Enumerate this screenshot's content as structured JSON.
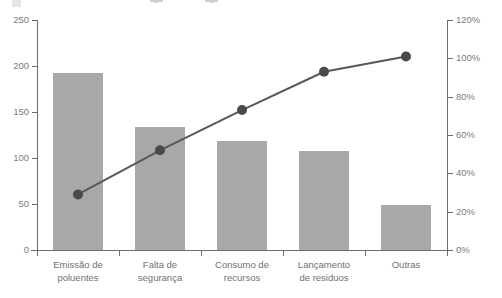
{
  "legend": {
    "entries": [
      {
        "name": "frequency-legend",
        "type": "bar-swatch",
        "label": ""
      },
      {
        "name": "cumulative-legend",
        "type": "line-swatch",
        "label": ""
      },
      {
        "name": "target-legend",
        "type": "line-swatch",
        "label": ""
      }
    ]
  },
  "colors": {
    "bar_fill": "#a8a8a8",
    "line_stroke": "#58585a",
    "marker_fill": "#4a4a4c",
    "axis": "#6e6e70",
    "tick_text": "#7b7b7d",
    "category_text": "#6f6f71",
    "plot_background": "#ffffff"
  },
  "axes": {
    "left": {
      "name": "frequency-axis",
      "ticks": [
        "0",
        "50",
        "100",
        "150",
        "200",
        "250"
      ],
      "min": 0,
      "max": 250
    },
    "right": {
      "name": "cumulative-percent-axis",
      "ticks": [
        "0%",
        "20%",
        "40%",
        "60%",
        "80%",
        "100%",
        "120%"
      ],
      "min": 0,
      "max": 120
    }
  },
  "chart_data": {
    "type": "bar",
    "title": "",
    "subtitle": "",
    "xlabel": "",
    "ylabel": "",
    "y2label": "",
    "grid": false,
    "legend_position": "top",
    "categories": [
      "Emissão de poluentes",
      "Falta de segurança",
      "Consumo de recursos",
      "Lançamento de resíduos",
      "Outras"
    ],
    "category_lines": [
      [
        "Emissão de",
        "poluentes"
      ],
      [
        "Falta de",
        "segurança"
      ],
      [
        "Consumo de",
        "recursos"
      ],
      [
        "Lançamento",
        "de residuos"
      ],
      [
        "Outras",
        ""
      ]
    ],
    "series": [
      {
        "name": "Frequência",
        "type": "bar",
        "axis": "left",
        "values": [
          192,
          134,
          119,
          108,
          49
        ]
      },
      {
        "name": "Percentual acumulado",
        "type": "line",
        "axis": "right",
        "values": [
          29,
          52,
          73,
          93,
          101
        ]
      }
    ],
    "ylim": [
      0,
      250
    ],
    "y2lim": [
      0,
      120
    ],
    "yticks": [
      0,
      50,
      100,
      150,
      200,
      250
    ],
    "y2ticks": [
      0,
      20,
      40,
      60,
      80,
      100,
      120
    ]
  }
}
